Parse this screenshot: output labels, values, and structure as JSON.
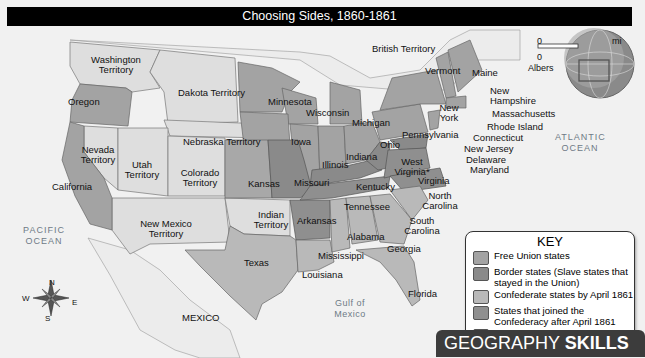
{
  "title": "Choosing Sides, 1860-1861",
  "colors": {
    "free_union": "#a3a3a3",
    "border": "#8a8a8a",
    "confederate": "#b9b9b9",
    "joined_after": "#8f8f8f",
    "territory": "#dedede",
    "water": "#f1f1f1"
  },
  "regions": {
    "british_territory": "British Territory",
    "washington": "Washington Territory",
    "oregon": "Oregon",
    "dakota": "Dakota Territory",
    "minnesota": "Minnesota",
    "wisconsin": "Wisconsin",
    "michigan": "Michigan",
    "nebraska": "Nebraska Territory",
    "iowa": "Iowa",
    "illinois": "Illinois",
    "indiana": "Indiana",
    "ohio": "Ohio",
    "pennsylvania": "Pennsylvania",
    "new_york": "New York",
    "vermont": "Vermont",
    "maine": "Maine",
    "new_hampshire": "New Hampshire",
    "massachusetts": "Massachusetts",
    "rhode_island": "Rhode Island",
    "connecticut": "Connecticut",
    "new_jersey": "New Jersey",
    "delaware": "Delaware",
    "maryland": "Maryland",
    "west_virginia": "West Virginia*",
    "virginia": "Virginia",
    "kentucky": "Kentucky",
    "north_carolina": "North Carolina",
    "tennessee": "Tennessee",
    "south_carolina": "South Carolina",
    "georgia": "Georgia",
    "alabama": "Alabama",
    "mississippi": "Mississippi",
    "louisiana": "Louisiana",
    "florida": "Florida",
    "arkansas": "Arkansas",
    "missouri": "Missouri",
    "kansas": "Kansas",
    "indian_territory": "Indian Territory",
    "texas": "Texas",
    "new_mexico": "New Mexico Territory",
    "colorado": "Colorado Territory",
    "utah": "Utah Territory",
    "nevada": "Nevada Territory",
    "california": "California",
    "mexico": "MEXICO"
  },
  "oceans": {
    "pacific": "PACIFIC OCEAN",
    "atlantic": "ATLANTIC OCEAN",
    "gulf": "Gulf of Mexico"
  },
  "scale": {
    "zero_top": "0",
    "zero_bottom": "0",
    "unit_mi": "mi",
    "projection": "Albers"
  },
  "compass": {
    "n": "N",
    "s": "S",
    "e": "E",
    "w": "W"
  },
  "key": {
    "title": "KEY",
    "items": [
      {
        "label": "Free Union states"
      },
      {
        "label": "Border states (Slave states that stayed in the Union)"
      },
      {
        "label": "Confederate states by April 1861"
      },
      {
        "label": "States that joined the Confederacy after April 1861"
      },
      {
        "label": "Territories"
      }
    ],
    "note": "*Became a state in 1863"
  },
  "banner": {
    "part1": "GEOGRAPHY ",
    "part2": "SKILLS"
  }
}
